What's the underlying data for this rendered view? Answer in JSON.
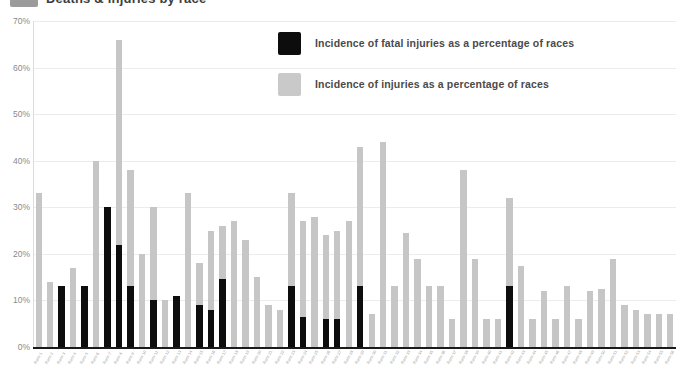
{
  "header": {
    "title": "Deaths & injuries by race",
    "swatch_color": "#9b9b9b"
  },
  "legend": {
    "position": "top-right",
    "items": [
      {
        "label": "Incidence of fatal injuries as a percentage of races",
        "color": "#0d0d0d",
        "swatch": "sw-black"
      },
      {
        "label": "Incidence of injuries as a percentage of races",
        "color": "#c9c9c9",
        "swatch": "sw-gray"
      }
    ]
  },
  "chart_data": {
    "type": "bar",
    "title": "Deaths & injuries by race",
    "xlabel": "",
    "ylabel": "",
    "ylim": [
      0,
      70
    ],
    "ytick_labels": [
      "0%",
      "10%",
      "20%",
      "30%",
      "40%",
      "50%",
      "60%",
      "70%"
    ],
    "ytick_values": [
      0,
      10,
      20,
      30,
      40,
      50,
      60,
      70
    ],
    "grid": true,
    "grid_axis": "y",
    "overlap": "overlaid",
    "categories": [
      "Race 1",
      "Race 2",
      "Race 3",
      "Race 4",
      "Race 5",
      "Race 6",
      "Race 7",
      "Race 8",
      "Race 9",
      "Race 10",
      "Race 11",
      "Race 12",
      "Race 13",
      "Race 14",
      "Race 15",
      "Race 16",
      "Race 17",
      "Race 18",
      "Race 19",
      "Race 20",
      "Race 21",
      "Race 22",
      "Race 23",
      "Race 24",
      "Race 25",
      "Race 26",
      "Race 27",
      "Race 28",
      "Race 29",
      "Race 30",
      "Race 31",
      "Race 32",
      "Race 33",
      "Race 34",
      "Race 35",
      "Race 36",
      "Race 37",
      "Race 38",
      "Race 39",
      "Race 40",
      "Race 41",
      "Race 42",
      "Race 43",
      "Race 44",
      "Race 45",
      "Race 46",
      "Race 47",
      "Race 48",
      "Race 49",
      "Race 50",
      "Race 51",
      "Race 52",
      "Race 53",
      "Race 54",
      "Race 55",
      "Race 56"
    ],
    "series": [
      {
        "name": "Incidence of injuries as a percentage of races",
        "color": "#c6c6c6",
        "values": [
          33,
          14,
          13,
          17,
          13,
          40,
          30,
          66,
          38,
          20,
          30,
          10,
          11,
          33,
          18,
          25,
          26,
          27,
          23,
          15,
          9,
          8,
          33,
          27,
          28,
          24,
          25,
          27,
          43,
          7,
          44,
          13,
          24.5,
          19,
          13,
          13,
          6,
          38,
          19,
          6,
          6,
          32,
          17.5,
          6,
          12,
          6,
          13,
          6,
          12,
          12.5,
          19,
          9,
          8,
          7,
          7,
          7
        ]
      },
      {
        "name": "Incidence of fatal injuries as a percentage of races",
        "color": "#0d0d0d",
        "values": [
          0,
          0,
          13,
          0,
          13,
          0,
          30,
          22,
          13,
          0,
          10,
          0,
          11,
          0,
          9,
          8,
          14.5,
          0,
          0,
          0,
          0,
          0,
          13,
          6.5,
          0,
          6,
          6,
          0,
          13,
          0,
          0,
          0,
          0,
          0,
          0,
          0,
          0,
          0,
          0,
          0,
          0,
          13,
          0,
          0,
          0,
          0,
          0,
          0,
          0,
          0,
          0,
          0,
          0,
          0,
          0,
          0
        ]
      }
    ]
  }
}
